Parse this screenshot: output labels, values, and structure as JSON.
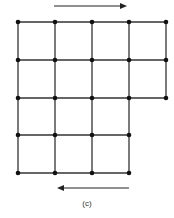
{
  "figure": {
    "caption": "(c)",
    "grid": {
      "columns_x": [
        18,
        55,
        92,
        129,
        166
      ],
      "rows_y": [
        22,
        60,
        98,
        135,
        173
      ],
      "row_extents": [
        5,
        5,
        5,
        4,
        4
      ],
      "line_color": "#333333",
      "node_color": "#111111"
    },
    "arrows": [
      {
        "name": "top-arrow-right",
        "direction": "right",
        "x1": 54,
        "x2": 127,
        "y": 6
      },
      {
        "name": "bottom-arrow-left",
        "direction": "left",
        "x1": 129,
        "x2": 57,
        "y": 188
      }
    ]
  }
}
